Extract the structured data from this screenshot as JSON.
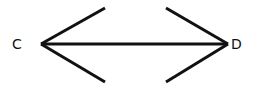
{
  "diagram": {
    "type": "double-headed-arrow",
    "stroke_color": "#111111",
    "background": "#ffffff",
    "labels": {
      "left": "C",
      "right": "D"
    },
    "points": {
      "C": [
        41,
        44
      ],
      "D": [
        228,
        44
      ]
    },
    "segments": [
      {
        "name": "shaft",
        "from": [
          41,
          44
        ],
        "to": [
          228,
          44
        ]
      },
      {
        "name": "left-upper-arm",
        "from": [
          41,
          44
        ],
        "to": [
          105,
          8
        ]
      },
      {
        "name": "left-lower-arm",
        "from": [
          41,
          44
        ],
        "to": [
          105,
          82
        ]
      },
      {
        "name": "right-upper-arm",
        "from": [
          228,
          44
        ],
        "to": [
          166,
          8
        ]
      },
      {
        "name": "right-lower-arm",
        "from": [
          228,
          44
        ],
        "to": [
          166,
          82
        ]
      }
    ]
  }
}
